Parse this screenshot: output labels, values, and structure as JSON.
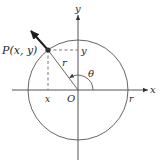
{
  "diagram": {
    "type": "unit-circle-angle",
    "labels": {
      "point": "P(x, y)",
      "y_axis": "y",
      "x_axis": "x",
      "origin": "O",
      "radius": "r",
      "radius_on_axis": "r",
      "angle": "θ",
      "x_coord": "x",
      "y_coord": "y"
    },
    "colors": {
      "background": "#ffffff",
      "lines": "#666666",
      "vector": "#1e1e1e",
      "text": "#2a2a2a"
    }
  }
}
